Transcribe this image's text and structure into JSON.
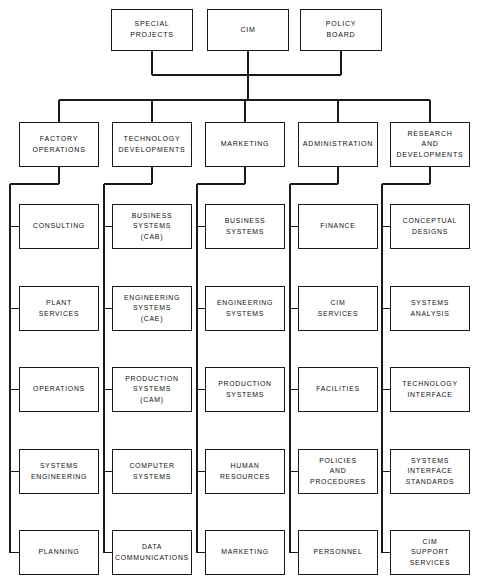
{
  "diagram": {
    "type": "organization-chart",
    "orientation": "top-down",
    "line_color": "#1a1a1a",
    "box_fill": "#ffffff",
    "text_color": "#111111"
  },
  "tiers": {
    "executive": {
      "name": "executive-tier",
      "nodes": [
        {
          "id": "special-projects",
          "label": "SPECIAL\nPROJECTS",
          "x": 111,
          "y": 9,
          "w": 82,
          "h": 42
        },
        {
          "id": "cim",
          "label": "CIM",
          "x": 207,
          "y": 9,
          "w": 82,
          "h": 42
        },
        {
          "id": "policy-board",
          "label": "POLICY\nBOARD",
          "x": 300,
          "y": 9,
          "w": 82,
          "h": 42
        }
      ]
    },
    "divisions": {
      "name": "division-tier",
      "nodes": [
        {
          "id": "factory-operations",
          "label": "FACTORY\nOPERATIONS",
          "x": 19,
          "y": 122,
          "w": 80,
          "h": 45
        },
        {
          "id": "technology-developments",
          "label": "TECHNOLOGY\nDEVELOPMENTS",
          "x": 112,
          "y": 122,
          "w": 80,
          "h": 45
        },
        {
          "id": "marketing-division",
          "label": "MARKETING",
          "x": 205,
          "y": 122,
          "w": 80,
          "h": 45
        },
        {
          "id": "administration",
          "label": "ADMINISTRATION",
          "x": 298,
          "y": 122,
          "w": 80,
          "h": 45
        },
        {
          "id": "research-and-developments",
          "label": "RESEARCH\nAND\nDEVELOPMENTS",
          "x": 390,
          "y": 122,
          "w": 80,
          "h": 45
        }
      ]
    }
  },
  "columns": [
    {
      "id": "factory-operations-column",
      "parent": "factory-operations",
      "spine_x": 10,
      "box_x": 19,
      "box_w": 80,
      "items": [
        {
          "id": "consulting",
          "label": "CONSULTING",
          "y": 204
        },
        {
          "id": "plant-services",
          "label": "PLANT\nSERVICES",
          "y": 286
        },
        {
          "id": "operations",
          "label": "OPERATIONS",
          "y": 367
        },
        {
          "id": "systems-engineering",
          "label": "SYSTEMS\nENGINEERING",
          "y": 449
        },
        {
          "id": "planning",
          "label": "PLANNING",
          "y": 530
        }
      ]
    },
    {
      "id": "technology-developments-column",
      "parent": "technology-developments",
      "spine_x": 104,
      "box_x": 112,
      "box_w": 80,
      "items": [
        {
          "id": "business-systems-cab",
          "label": "BUSINESS\nSYSTEMS\n(CAB)",
          "y": 204
        },
        {
          "id": "engineering-systems-cae",
          "label": "ENGINEERING\nSYSTEMS\n(CAE)",
          "y": 286
        },
        {
          "id": "production-systems-cam",
          "label": "PRODUCTION\nSYSTEMS\n(CAM)",
          "y": 367
        },
        {
          "id": "computer-systems",
          "label": "COMPUTER\nSYSTEMS",
          "y": 449
        },
        {
          "id": "data-communications",
          "label": "DATA\nCOMMUNICATIONS",
          "y": 530
        }
      ]
    },
    {
      "id": "marketing-column",
      "parent": "marketing-division",
      "spine_x": 197,
      "box_x": 205,
      "box_w": 80,
      "items": [
        {
          "id": "business-systems",
          "label": "BUSINESS\nSYSTEMS",
          "y": 204
        },
        {
          "id": "engineering-systems",
          "label": "ENGINEERING\nSYSTEMS",
          "y": 286
        },
        {
          "id": "production-systems",
          "label": "PRODUCTION\nSYSTEMS",
          "y": 367
        },
        {
          "id": "human-resources",
          "label": "HUMAN\nRESOURCES",
          "y": 449
        },
        {
          "id": "marketing",
          "label": "MARKETING",
          "y": 530
        }
      ]
    },
    {
      "id": "administration-column",
      "parent": "administration",
      "spine_x": 290,
      "box_x": 298,
      "box_w": 80,
      "items": [
        {
          "id": "finance",
          "label": "FINANCE",
          "y": 204
        },
        {
          "id": "cim-services",
          "label": "CIM\nSERVICES",
          "y": 286
        },
        {
          "id": "facilities",
          "label": "FACILITIES",
          "y": 367
        },
        {
          "id": "policies-and-procedures",
          "label": "POLICIES\nAND\nPROCEDURES",
          "y": 449
        },
        {
          "id": "personnel",
          "label": "PERSONNEL",
          "y": 530
        }
      ]
    },
    {
      "id": "research-and-developments-column",
      "parent": "research-and-developments",
      "spine_x": 382,
      "box_x": 390,
      "box_w": 80,
      "items": [
        {
          "id": "conceptual-designs",
          "label": "CONCEPTUAL\nDESIGNS",
          "y": 204
        },
        {
          "id": "systems-analysis",
          "label": "SYSTEMS\nANALYSIS",
          "y": 286
        },
        {
          "id": "technology-interface",
          "label": "TECHNOLOGY\nINTERFACE",
          "y": 367
        },
        {
          "id": "systems-interface-standards",
          "label": "SYSTEMS\nINTERFACE\nSTANDARDS",
          "y": 449
        },
        {
          "id": "cim-support-services",
          "label": "CIM\nSUPPORT\nSERVICES",
          "y": 530
        }
      ]
    }
  ],
  "geometry": {
    "item_h": 45,
    "exec_bus_y": 75,
    "division_bus_y": 100,
    "cim_stem_x": 248,
    "column_drop_y": 184
  }
}
